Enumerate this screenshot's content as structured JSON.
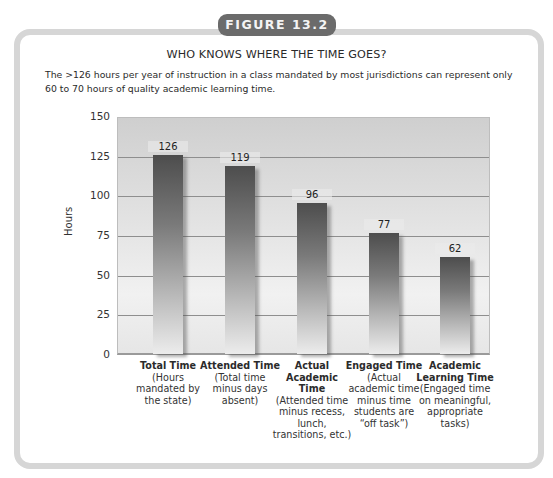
{
  "figure_label": "FIGURE 13.2",
  "title": "WHO KNOWS WHERE THE TIME GOES?",
  "caption": "The >126 hours per year of instruction in a class mandated by most jurisdictions can represent only 60 to 70 hours of quality academic learning time.",
  "y_axis": {
    "label": "Hours",
    "ticks": [
      "150",
      "125",
      "100",
      "75",
      "50",
      "25",
      "0"
    ]
  },
  "categories": [
    {
      "name_line1": "Total",
      "name_line2": "Time",
      "desc": "(Hours mandated by the state)",
      "value_label": "126"
    },
    {
      "name_line1": "Attended",
      "name_line2": "Time",
      "desc": "(Total time minus days absent)",
      "value_label": "119"
    },
    {
      "name_line1": "Actual Academic",
      "name_line2": "Time",
      "desc": "(Attended time minus recess, lunch, transitions, etc.)",
      "value_label": "96"
    },
    {
      "name_line1": "Engaged",
      "name_line2": "Time",
      "desc": "(Actual academic time minus time students are “off task”)",
      "value_label": "77"
    },
    {
      "name_line1": "Academic Learning",
      "name_line2": "Time",
      "desc": "(Engaged time on meaningful, appropriate tasks)",
      "value_label": "62"
    }
  ],
  "colors": {
    "badge": "#6b6b6b",
    "frame": "#d6d6d6",
    "bar_top": "#4d4d4d",
    "bar_bottom": "#ececec"
  },
  "chart_data": {
    "type": "bar",
    "title": "WHO KNOWS WHERE THE TIME GOES?",
    "subtitle": "The >126 hours per year of instruction in a class mandated by most jurisdictions can represent only 60 to 70 hours of quality academic learning time.",
    "categories": [
      "Total Time (Hours mandated by the state)",
      "Attended Time (Total time minus days absent)",
      "Actual Academic Time (Attended time minus recess, lunch, transitions, etc.)",
      "Engaged Time (Actual academic time minus time students are “off task”)",
      "Academic Learning Time (Engaged time on meaningful, appropriate tasks)"
    ],
    "values": [
      126,
      119,
      96,
      77,
      62
    ],
    "xlabel": "",
    "ylabel": "Hours",
    "ylim": [
      0,
      150
    ],
    "yticks": [
      0,
      25,
      50,
      75,
      100,
      125,
      150
    ],
    "grid": true,
    "legend": null,
    "data_labels": true
  }
}
